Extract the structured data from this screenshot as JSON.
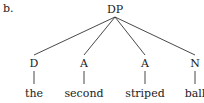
{
  "example_label": "b.",
  "tree": {
    "root": "DP",
    "children": [
      {
        "category": "D",
        "word": "the"
      },
      {
        "category": "A",
        "word": "second"
      },
      {
        "category": "A",
        "word": "striped"
      },
      {
        "category": "N",
        "word": "ball"
      }
    ]
  },
  "colors": {
    "ink": "#222222",
    "background": "#ffffff"
  }
}
